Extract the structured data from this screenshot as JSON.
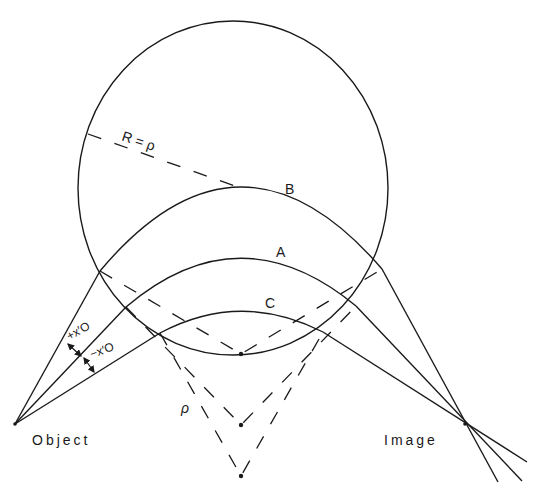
{
  "diagram": {
    "colors": {
      "ink": "#1a1a1a",
      "background": "#ffffff"
    },
    "labels": {
      "object": "Object",
      "image": "Image",
      "arc_a": "A",
      "arc_b": "B",
      "arc_c": "C",
      "radius": "R = ρ",
      "rho": "ρ",
      "plus_offset": "+x′O",
      "minus_offset": "−x′O"
    },
    "points": {
      "object": [
        15,
        424
      ],
      "image": [
        465,
        424
      ],
      "centers_of_curvature": [
        [
          241,
          354
        ],
        [
          241,
          425
        ],
        [
          241,
          476
        ]
      ]
    },
    "circle": {
      "cx": 233,
      "cy": 188,
      "rx": 155,
      "ry": 167
    }
  }
}
